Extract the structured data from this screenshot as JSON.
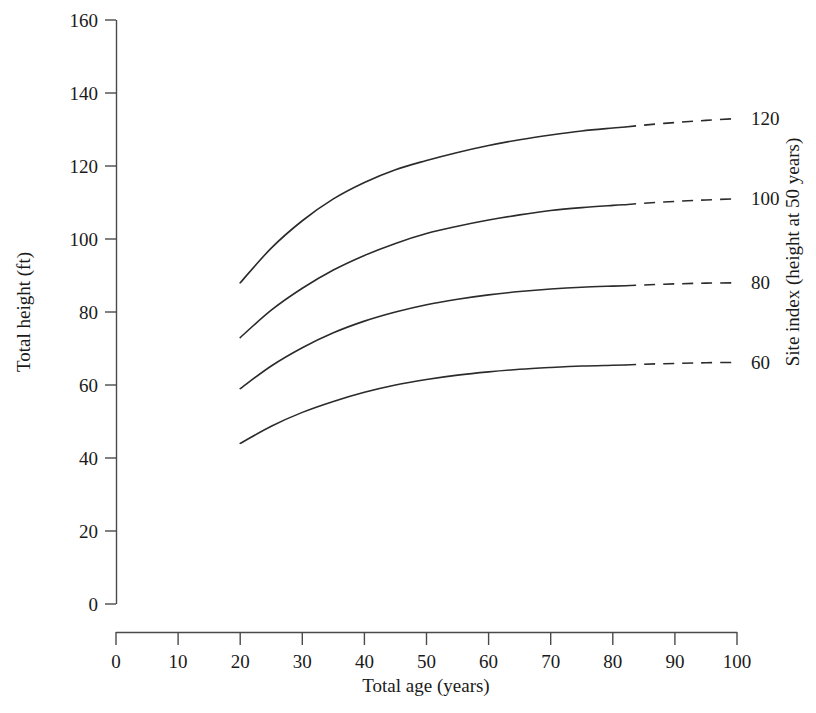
{
  "chart_data": {
    "type": "line",
    "title": "",
    "xlabel": "Total age (years)",
    "ylabel": "Total height (ft)",
    "right_axis_label": "Site index (height at 50 years)",
    "xlim": [
      0,
      100
    ],
    "ylim": [
      0,
      160
    ],
    "xticks": [
      0,
      10,
      20,
      30,
      40,
      50,
      60,
      70,
      80,
      90,
      100
    ],
    "xtick_labels": [
      "0",
      "10",
      "20",
      "30",
      "40",
      "50",
      "60",
      "70",
      "80",
      "90",
      "100"
    ],
    "yticks": [
      0,
      20,
      40,
      60,
      80,
      100,
      120,
      140,
      160
    ],
    "ytick_labels": [
      "0",
      "20",
      "40",
      "60",
      "80",
      "100",
      "120",
      "140",
      "160"
    ],
    "grid": false,
    "legend_position": "right-curve-labels",
    "line_color": "#2b2b2b",
    "line_width": 1.6,
    "solid_x_range": [
      20,
      82
    ],
    "dashed_x_range": [
      82,
      100
    ],
    "x": [
      20,
      25,
      30,
      35,
      40,
      45,
      50,
      55,
      60,
      65,
      70,
      75,
      80,
      82,
      85,
      90,
      95,
      100
    ],
    "series": [
      {
        "name": "120",
        "label": "120",
        "site_index": 120,
        "values": [
          88,
          97.5,
          105,
          111,
          115.5,
          119,
          121.5,
          123.7,
          125.6,
          127.2,
          128.5,
          129.6,
          130.4,
          130.7,
          131.2,
          131.9,
          132.5,
          133.0
        ]
      },
      {
        "name": "100",
        "label": "100",
        "site_index": 100,
        "values": [
          73,
          80.5,
          86.5,
          91.5,
          95.5,
          98.8,
          101.5,
          103.5,
          105.2,
          106.6,
          107.8,
          108.6,
          109.2,
          109.4,
          109.8,
          110.3,
          110.7,
          111.0
        ]
      },
      {
        "name": "80",
        "label": "80",
        "site_index": 80,
        "values": [
          59,
          65.2,
          70.2,
          74.3,
          77.5,
          80.0,
          82.0,
          83.5,
          84.7,
          85.6,
          86.3,
          86.8,
          87.1,
          87.2,
          87.4,
          87.7,
          87.9,
          88.0
        ]
      },
      {
        "name": "60",
        "label": "60",
        "site_index": 60,
        "values": [
          44,
          48.7,
          52.5,
          55.5,
          58.0,
          60.0,
          61.5,
          62.7,
          63.6,
          64.3,
          64.8,
          65.2,
          65.4,
          65.5,
          65.7,
          65.9,
          66.1,
          66.2
        ]
      }
    ]
  },
  "axes": {
    "left": {
      "title": "Total height (ft)",
      "ticks": [
        "160",
        "140",
        "120",
        "100",
        "80",
        "60",
        "40",
        "20",
        "0"
      ]
    },
    "bottom": {
      "title": "Total age (years)",
      "ticks": [
        "0",
        "10",
        "20",
        "30",
        "40",
        "50",
        "60",
        "70",
        "80",
        "90",
        "100"
      ]
    },
    "right": {
      "title": "Site index (height at 50 years)",
      "curve_labels": [
        "120",
        "100",
        "80",
        "60"
      ]
    }
  }
}
